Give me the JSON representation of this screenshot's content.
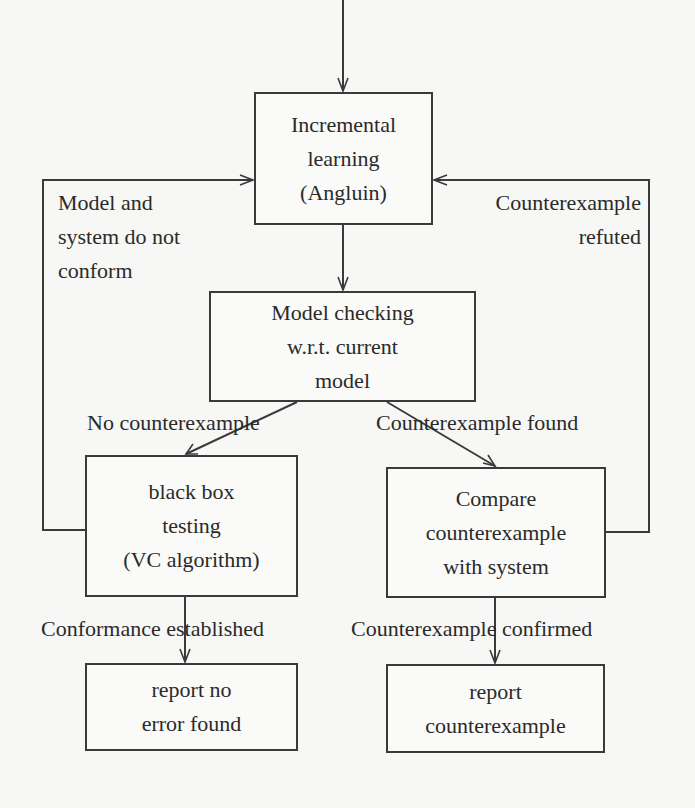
{
  "diagram": {
    "type": "flowchart",
    "colors": {
      "background": "#f7f7f5",
      "stroke": "#3a3a3a",
      "text": "#2a2a2a"
    },
    "nodes": {
      "incremental_learning": {
        "lines": [
          "Incremental",
          "learning",
          "(Angluin)"
        ],
        "box": {
          "x": 254,
          "y": 92,
          "w": 179,
          "h": 133
        }
      },
      "model_checking": {
        "lines": [
          "Model checking",
          "w.r.t. current",
          "model"
        ],
        "box": {
          "x": 209,
          "y": 291,
          "w": 267,
          "h": 111
        }
      },
      "black_box_testing": {
        "lines": [
          "black box",
          "testing",
          "(VC algorithm)"
        ],
        "box": {
          "x": 85,
          "y": 455,
          "w": 213,
          "h": 142
        }
      },
      "compare_counterexample": {
        "lines": [
          "Compare",
          "counterexample",
          "with system"
        ],
        "box": {
          "x": 386,
          "y": 467,
          "w": 220,
          "h": 131
        }
      },
      "report_no_error": {
        "lines": [
          "report no",
          "error found"
        ],
        "box": {
          "x": 85,
          "y": 663,
          "w": 213,
          "h": 88
        }
      },
      "report_counterexample": {
        "lines": [
          "report",
          "counterexample"
        ],
        "box": {
          "x": 386,
          "y": 664,
          "w": 219,
          "h": 89
        }
      }
    },
    "edge_labels": {
      "model_system_not_conform": {
        "lines": [
          "Model and",
          "system do not",
          "conform"
        ],
        "x": 58,
        "y": 190
      },
      "counterexample_refuted": {
        "lines": [
          "Counterexample",
          "refuted"
        ],
        "x": 459,
        "y": 190
      },
      "no_counterexample": {
        "text": "No counterexample",
        "x": 87,
        "y": 409
      },
      "counterexample_found": {
        "text": "Counterexample found",
        "x": 376,
        "y": 409
      },
      "conformance_established": {
        "text": "Conformance established",
        "x": 41,
        "y": 618
      },
      "counterexample_confirmed": {
        "text": "Counterexample confirmed",
        "x": 351,
        "y": 618
      }
    },
    "edges": [
      {
        "id": "entry",
        "from": "start",
        "to": "incremental_learning"
      },
      {
        "id": "learn_to_check",
        "from": "incremental_learning",
        "to": "model_checking"
      },
      {
        "id": "check_to_test",
        "from": "model_checking",
        "to": "black_box_testing",
        "label": "No counterexample"
      },
      {
        "id": "check_to_compare",
        "from": "model_checking",
        "to": "compare_counterexample",
        "label": "Counterexample found"
      },
      {
        "id": "test_to_learn",
        "from": "black_box_testing",
        "to": "incremental_learning",
        "label": "Model and system do not conform"
      },
      {
        "id": "compare_to_learn",
        "from": "compare_counterexample",
        "to": "incremental_learning",
        "label": "Counterexample refuted"
      },
      {
        "id": "test_to_report_ok",
        "from": "black_box_testing",
        "to": "report_no_error",
        "label": "Conformance established"
      },
      {
        "id": "compare_to_report_cex",
        "from": "compare_counterexample",
        "to": "report_counterexample",
        "label": "Counterexample confirmed"
      }
    ]
  }
}
